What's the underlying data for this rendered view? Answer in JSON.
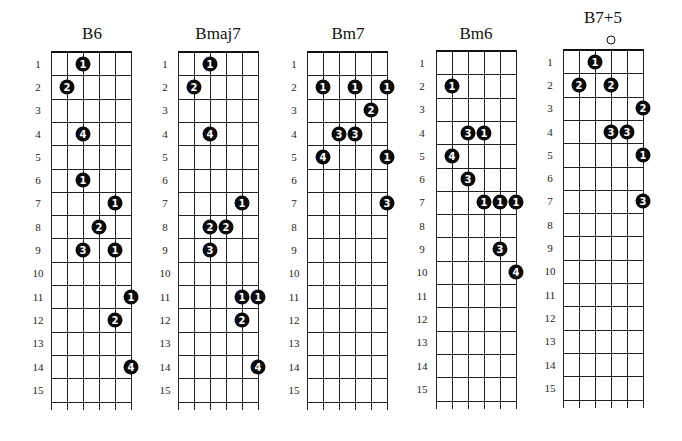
{
  "layout": {
    "fret_count": 15,
    "string_count": 6,
    "string_spacing": 16,
    "fret_height": 23.3,
    "tail": 8
  },
  "fret_labels": [
    "1",
    "2",
    "3",
    "4",
    "5",
    "6",
    "7",
    "8",
    "9",
    "10",
    "11",
    "12",
    "13",
    "14",
    "15"
  ],
  "charts": [
    {
      "name": "B6",
      "left": 51,
      "top": 52,
      "title_x": 92,
      "label_x": 38,
      "open": [],
      "dots": [
        {
          "fret": 1,
          "string": 3,
          "finger": "1"
        },
        {
          "fret": 2,
          "string": 2,
          "finger": "2"
        },
        {
          "fret": 4,
          "string": 3,
          "finger": "4"
        },
        {
          "fret": 6,
          "string": 3,
          "finger": "1"
        },
        {
          "fret": 7,
          "string": 5,
          "finger": "1"
        },
        {
          "fret": 8,
          "string": 4,
          "finger": "2"
        },
        {
          "fret": 9,
          "string": 3,
          "finger": "3"
        },
        {
          "fret": 9,
          "string": 5,
          "finger": "1"
        },
        {
          "fret": 11,
          "string": 6,
          "finger": "1"
        },
        {
          "fret": 12,
          "string": 5,
          "finger": "2"
        },
        {
          "fret": 14,
          "string": 6,
          "finger": "4"
        }
      ]
    },
    {
      "name": "Bmaj7",
      "left": 178,
      "top": 52,
      "title_x": 218,
      "label_x": 165,
      "open": [],
      "dots": [
        {
          "fret": 1,
          "string": 3,
          "finger": "1"
        },
        {
          "fret": 2,
          "string": 2,
          "finger": "2"
        },
        {
          "fret": 4,
          "string": 3,
          "finger": "4"
        },
        {
          "fret": 7,
          "string": 5,
          "finger": "1"
        },
        {
          "fret": 8,
          "string": 3,
          "finger": "2"
        },
        {
          "fret": 8,
          "string": 4,
          "finger": "2"
        },
        {
          "fret": 9,
          "string": 3,
          "finger": "3"
        },
        {
          "fret": 11,
          "string": 5,
          "finger": "1"
        },
        {
          "fret": 11,
          "string": 6,
          "finger": "1"
        },
        {
          "fret": 12,
          "string": 5,
          "finger": "2"
        },
        {
          "fret": 14,
          "string": 6,
          "finger": "4"
        }
      ]
    },
    {
      "name": "Bm7",
      "left": 307,
      "top": 52,
      "title_x": 348,
      "label_x": 294,
      "open": [],
      "dots": [
        {
          "fret": 2,
          "string": 2,
          "finger": "1"
        },
        {
          "fret": 2,
          "string": 4,
          "finger": "1"
        },
        {
          "fret": 2,
          "string": 6,
          "finger": "1"
        },
        {
          "fret": 3,
          "string": 5,
          "finger": "2"
        },
        {
          "fret": 4,
          "string": 3,
          "finger": "3"
        },
        {
          "fret": 4,
          "string": 4,
          "finger": "3"
        },
        {
          "fret": 5,
          "string": 2,
          "finger": "4"
        },
        {
          "fret": 5,
          "string": 6,
          "finger": "1"
        },
        {
          "fret": 7,
          "string": 6,
          "finger": "3"
        }
      ]
    },
    {
      "name": "Bm6",
      "left": 436,
      "top": 51,
      "title_x": 476,
      "label_x": 422,
      "open": [],
      "dots": [
        {
          "fret": 2,
          "string": 2,
          "finger": "1"
        },
        {
          "fret": 4,
          "string": 3,
          "finger": "3"
        },
        {
          "fret": 4,
          "string": 4,
          "finger": "1"
        },
        {
          "fret": 5,
          "string": 2,
          "finger": "4"
        },
        {
          "fret": 6,
          "string": 3,
          "finger": "3"
        },
        {
          "fret": 7,
          "string": 4,
          "finger": "1"
        },
        {
          "fret": 7,
          "string": 5,
          "finger": "1"
        },
        {
          "fret": 7,
          "string": 6,
          "finger": "1"
        },
        {
          "fret": 9,
          "string": 5,
          "finger": "3"
        },
        {
          "fret": 10,
          "string": 6,
          "finger": "4"
        }
      ]
    },
    {
      "name": "B7+5",
      "left": 563,
      "top": 50,
      "title_x": 603,
      "label_x": 550,
      "open": [
        4
      ],
      "dots": [
        {
          "fret": 1,
          "string": 3,
          "finger": "1"
        },
        {
          "fret": 2,
          "string": 2,
          "finger": "2"
        },
        {
          "fret": 2,
          "string": 4,
          "finger": "2"
        },
        {
          "fret": 3,
          "string": 6,
          "finger": "2"
        },
        {
          "fret": 4,
          "string": 4,
          "finger": "3"
        },
        {
          "fret": 4,
          "string": 5,
          "finger": "3"
        },
        {
          "fret": 5,
          "string": 6,
          "finger": "1"
        },
        {
          "fret": 7,
          "string": 6,
          "finger": "3"
        }
      ]
    }
  ]
}
